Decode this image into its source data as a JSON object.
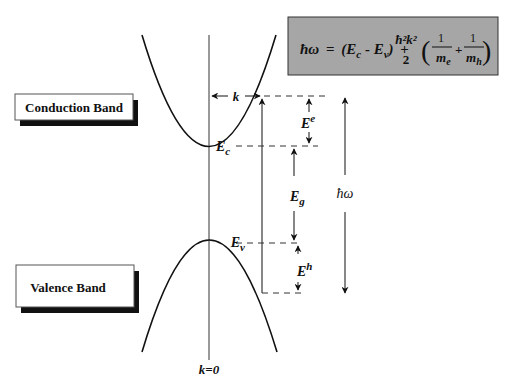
{
  "diagram": {
    "type": "band-structure-direct-transition",
    "formula": {
      "lhs": "ħω",
      "eq": "=",
      "term1": "(E",
      "term1_sub_c": "c",
      "term1_mid": " - E",
      "term1_sub_v": "v",
      "term1_end": ")",
      "plus": "+",
      "frac_num": "ħ²k²",
      "frac_den": "2",
      "inner1_num": "1",
      "inner1_den": "m",
      "inner1_den_sub": "e",
      "inner_plus": "+",
      "inner2_num": "1",
      "inner2_den": "m",
      "inner2_den_sub": "h",
      "box_color": "#a6a6a6"
    },
    "boxes": {
      "conduction": "Conduction Band",
      "valence": "Valence Band"
    },
    "labels": {
      "k": "k",
      "Ec": "E",
      "Ec_sub": "c",
      "Ev": "E",
      "Ev_sub": "v",
      "Ee": "E",
      "Ee_sup": "e",
      "Eg": "E",
      "Eg_sub": "g",
      "Eh": "E",
      "Eh_sup": "h",
      "hw": "ħω",
      "k0": "k=0"
    }
  }
}
